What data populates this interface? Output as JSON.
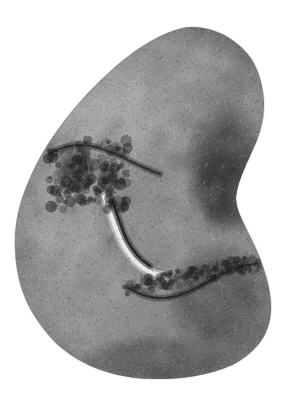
{
  "figure": {
    "kind": "photograph",
    "caption": "",
    "width": 288,
    "height": 396,
    "background_color": "#ffffff",
    "color_mode": "grayscale"
  },
  "palette": {
    "background": "#ffffff",
    "stone_light": "#a8a8a8",
    "stone_mid": "#8c8c8c",
    "stone_midlight": "#9e9e9e",
    "stone_dark": "#5a5a5a",
    "stone_darkest": "#343434",
    "edge_shadow": "#6e6e6e",
    "highlight_seam": "#ededed",
    "crack_dark": "#1f1f1f",
    "grain_dark": "#000000",
    "grain_light": "#ffffff"
  },
  "stone": {
    "name": "cobble",
    "outline": [
      [
        190,
        27
      ],
      [
        208,
        29
      ],
      [
        226,
        36
      ],
      [
        241,
        47
      ],
      [
        252,
        60
      ],
      [
        259,
        75
      ],
      [
        263,
        92
      ],
      [
        264,
        108
      ],
      [
        262,
        124
      ],
      [
        257,
        140
      ],
      [
        250,
        156
      ],
      [
        243,
        172
      ],
      [
        238,
        186
      ],
      [
        236,
        198
      ],
      [
        238,
        210
      ],
      [
        244,
        224
      ],
      [
        252,
        240
      ],
      [
        260,
        258
      ],
      [
        266,
        276
      ],
      [
        270,
        294
      ],
      [
        271,
        311
      ],
      [
        268,
        327
      ],
      [
        261,
        341
      ],
      [
        250,
        353
      ],
      [
        236,
        363
      ],
      [
        219,
        370
      ],
      [
        200,
        375
      ],
      [
        180,
        378
      ],
      [
        158,
        379
      ],
      [
        136,
        378
      ],
      [
        114,
        374
      ],
      [
        93,
        367
      ],
      [
        74,
        357
      ],
      [
        57,
        344
      ],
      [
        43,
        328
      ],
      [
        31,
        310
      ],
      [
        22,
        290
      ],
      [
        17,
        269
      ],
      [
        15,
        247
      ],
      [
        16,
        225
      ],
      [
        21,
        202
      ],
      [
        30,
        178
      ],
      [
        42,
        154
      ],
      [
        57,
        131
      ],
      [
        74,
        109
      ],
      [
        93,
        88
      ],
      [
        113,
        69
      ],
      [
        134,
        52
      ],
      [
        155,
        39
      ],
      [
        173,
        31
      ]
    ],
    "tone_regions": [
      {
        "name": "upper-left-light",
        "cx": 110,
        "cy": 105,
        "rx": 78,
        "ry": 72,
        "color": "#a6a6a6"
      },
      {
        "name": "upper-crown",
        "cx": 175,
        "cy": 70,
        "rx": 62,
        "ry": 44,
        "color": "#9b9b9b"
      },
      {
        "name": "left-flank-light",
        "cx": 62,
        "cy": 215,
        "rx": 50,
        "ry": 78,
        "color": "#9f9f9f"
      },
      {
        "name": "lower-left-light",
        "cx": 82,
        "cy": 300,
        "rx": 62,
        "ry": 58,
        "color": "#9a9a9a"
      },
      {
        "name": "center-mid",
        "cx": 150,
        "cy": 210,
        "rx": 58,
        "ry": 62,
        "color": "#8e8e8e"
      },
      {
        "name": "right-flank-dark",
        "cx": 226,
        "cy": 170,
        "rx": 44,
        "ry": 70,
        "color": "#4f4f4f"
      },
      {
        "name": "right-darkest-core",
        "cx": 224,
        "cy": 188,
        "rx": 28,
        "ry": 45,
        "color": "#3a3a3a"
      },
      {
        "name": "lower-right-dark",
        "cx": 220,
        "cy": 300,
        "rx": 56,
        "ry": 62,
        "color": "#5d5d5d"
      },
      {
        "name": "bottom-rim-shadow",
        "cx": 160,
        "cy": 360,
        "rx": 86,
        "ry": 26,
        "color": "#6a6a6a"
      }
    ],
    "features": [
      {
        "name": "fracture-scar-arc",
        "type": "dark-line",
        "color": "#262626",
        "path": [
          [
            128,
            288
          ],
          [
            146,
            296
          ],
          [
            166,
            298
          ],
          [
            188,
            292
          ],
          [
            208,
            282
          ],
          [
            226,
            272
          ],
          [
            243,
            266
          ],
          [
            256,
            264
          ]
        ]
      },
      {
        "name": "upper-fracture-rim",
        "type": "dark-line",
        "color": "#2e2e2e",
        "path": [
          [
            52,
            152
          ],
          [
            70,
            146
          ],
          [
            90,
            146
          ],
          [
            110,
            152
          ],
          [
            128,
            160
          ],
          [
            145,
            168
          ],
          [
            160,
            174
          ]
        ]
      },
      {
        "name": "highlight-seam",
        "type": "bright-ridge",
        "color": "#ececec",
        "path": [
          [
            100,
            188
          ],
          [
            108,
            206
          ],
          [
            115,
            226
          ],
          [
            124,
            246
          ],
          [
            136,
            262
          ],
          [
            150,
            272
          ],
          [
            164,
            276
          ]
        ]
      },
      {
        "name": "crack-beside-seam",
        "type": "dark-line",
        "color": "#1c1c1c",
        "path": [
          [
            112,
            200
          ],
          [
            119,
            220
          ],
          [
            127,
            240
          ],
          [
            138,
            256
          ],
          [
            150,
            266
          ]
        ]
      },
      {
        "name": "pitted-patch-upper-left",
        "type": "dark-blotch",
        "color": "#3b3b3b",
        "cx": 76,
        "cy": 170,
        "rx": 22,
        "ry": 24
      },
      {
        "name": "pitted-patch-secondary",
        "type": "dark-blotch",
        "color": "#474747",
        "cx": 108,
        "cy": 178,
        "rx": 13,
        "ry": 16
      },
      {
        "name": "right-notch-shadow",
        "type": "concave-shadow",
        "color": "#5a5a5a",
        "cx": 243,
        "cy": 200,
        "rx": 20,
        "ry": 34
      }
    ],
    "grain": {
      "density": 17000,
      "max_alpha": 0.3,
      "seed": 20240617
    }
  }
}
